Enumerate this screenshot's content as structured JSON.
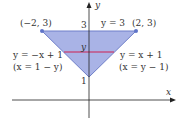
{
  "diagram": {
    "colors": {
      "region_fill": "#a9b3e6",
      "region_stroke": "#6f7fc9",
      "vertex": "#5f74c8",
      "axis": "#222222",
      "cross_section": "#d02050",
      "text": "#333333"
    },
    "axes": {
      "x_label": "x",
      "y_label": "y"
    },
    "ticks": {
      "y3": "3",
      "y1": "1"
    },
    "vertices": {
      "left": "(−2, 3)",
      "right": "(2, 3)"
    },
    "labels": {
      "top_line": "y = 3",
      "cross_section_y": "y",
      "left_line": "y = −x + 1",
      "left_line_alt": "(x = 1 − y)",
      "right_line": "y = x + 1",
      "right_line_alt": "(x = y − 1)"
    }
  }
}
